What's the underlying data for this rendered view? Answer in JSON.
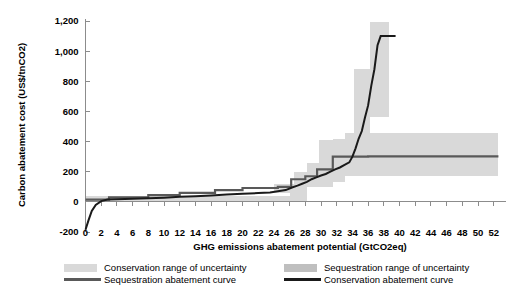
{
  "chart_data": {
    "type": "line",
    "title": "",
    "xlabel": "GHG emissions abatement  potential (GtCO2eq)",
    "ylabel": "Carbon abatement cost (US$/tnCO2)",
    "xlim": [
      0,
      53.5
    ],
    "ylim": [
      -200,
      1200
    ],
    "xticks": [
      0,
      2,
      4,
      6,
      8,
      10,
      12,
      14,
      16,
      18,
      20,
      22,
      24,
      26,
      28,
      30,
      32,
      34,
      36,
      38,
      40,
      42,
      44,
      46,
      48,
      50,
      52
    ],
    "xtick_labels": [
      "0",
      "2",
      "4",
      "6",
      "8",
      "10",
      "12",
      "14",
      "16",
      "18",
      "20",
      "22",
      "24",
      "26",
      "28",
      "30",
      "32",
      "34",
      "36",
      "38",
      "40",
      "42",
      "44",
      "46",
      "48",
      "50",
      "52"
    ],
    "yticks": [
      -200,
      0,
      200,
      400,
      600,
      800,
      1000,
      1200
    ],
    "ytick_labels": [
      "-200",
      "0",
      "200",
      "400",
      "600",
      "800",
      "1,000",
      "1,200"
    ],
    "grid": false,
    "legend_position": "bottom",
    "series": [
      {
        "name": "Sequestration abatement curve",
        "color": "#595959",
        "type": "step",
        "points": [
          [
            0,
            15
          ],
          [
            3.0,
            15
          ],
          [
            3.0,
            30
          ],
          [
            8.0,
            30
          ],
          [
            8.0,
            45
          ],
          [
            12.0,
            45
          ],
          [
            12.0,
            60
          ],
          [
            16.5,
            60
          ],
          [
            16.5,
            78
          ],
          [
            20.0,
            78
          ],
          [
            20.0,
            92
          ],
          [
            24.5,
            92
          ],
          [
            24.5,
            100
          ],
          [
            26.2,
            100
          ],
          [
            26.2,
            150
          ],
          [
            28.0,
            150
          ],
          [
            28.0,
            170
          ],
          [
            29.5,
            170
          ],
          [
            29.5,
            215
          ],
          [
            31.5,
            215
          ],
          [
            31.5,
            300
          ],
          [
            36.0,
            300
          ],
          [
            36.0,
            302
          ],
          [
            52.6,
            302
          ]
        ]
      },
      {
        "name": "Conservation abatement curve",
        "color": "#1a1a1a",
        "type": "step",
        "points": [
          [
            0,
            -185
          ],
          [
            0.4,
            -120
          ],
          [
            0.8,
            -60
          ],
          [
            1.3,
            -20
          ],
          [
            2.0,
            5
          ],
          [
            2.8,
            15
          ],
          [
            4.0,
            18
          ],
          [
            6.0,
            20
          ],
          [
            8.0,
            24
          ],
          [
            10.0,
            28
          ],
          [
            12.0,
            34
          ],
          [
            14.0,
            38
          ],
          [
            16.0,
            42
          ],
          [
            18.0,
            48
          ],
          [
            20.0,
            54
          ],
          [
            22.0,
            58
          ],
          [
            23.5,
            62
          ],
          [
            24.5,
            70
          ],
          [
            25.5,
            78
          ],
          [
            26.3,
            95
          ],
          [
            27.0,
            108
          ],
          [
            27.6,
            120
          ],
          [
            28.2,
            132
          ],
          [
            28.8,
            150
          ],
          [
            29.4,
            162
          ],
          [
            30.0,
            175
          ],
          [
            30.6,
            185
          ],
          [
            31.2,
            200
          ],
          [
            31.8,
            215
          ],
          [
            32.4,
            228
          ],
          [
            33.0,
            245
          ],
          [
            33.6,
            262
          ],
          [
            34.0,
            300
          ],
          [
            34.4,
            355
          ],
          [
            34.8,
            420
          ],
          [
            35.2,
            470
          ],
          [
            35.6,
            560
          ],
          [
            36.0,
            640
          ],
          [
            36.4,
            770
          ],
          [
            36.8,
            880
          ],
          [
            37.2,
            1040
          ],
          [
            37.6,
            1100
          ],
          [
            39.5,
            1100
          ]
        ]
      }
    ],
    "bands": [
      {
        "name": "Conservation range of uncertainty",
        "color": "#d9d9d9",
        "segments": [
          {
            "x0": 0.0,
            "x1": 26.0,
            "y0": 0,
            "y1": 38
          },
          {
            "x0": 26.0,
            "x1": 28.2,
            "y0": 0,
            "y1": 120
          },
          {
            "x0": 28.2,
            "x1": 31.5,
            "y0": 100,
            "y1": 255
          },
          {
            "x0": 31.5,
            "x1": 34.2,
            "y0": 175,
            "y1": 420
          },
          {
            "x0": 34.2,
            "x1": 36.2,
            "y0": 290,
            "y1": 880
          },
          {
            "x0": 36.2,
            "x1": 38.6,
            "y0": 560,
            "y1": 1195
          }
        ]
      },
      {
        "name": "Sequestration range of uncertainty",
        "color": "#d9d9d9",
        "segments": [
          {
            "x0": 0.0,
            "x1": 24.0,
            "y0": 5,
            "y1": 32
          },
          {
            "x0": 24.0,
            "x1": 26.5,
            "y0": 60,
            "y1": 120
          },
          {
            "x0": 26.5,
            "x1": 29.8,
            "y0": 110,
            "y1": 200
          },
          {
            "x0": 29.8,
            "x1": 33.0,
            "y0": 130,
            "y1": 410
          },
          {
            "x0": 33.0,
            "x1": 52.6,
            "y0": 170,
            "y1": 455
          }
        ]
      }
    ],
    "legend": [
      {
        "key": "conservation-band",
        "label": "Conservation range of uncertainty",
        "marker": "swatch",
        "color": "#d9d9d9"
      },
      {
        "key": "sequestration-band",
        "label": "Sequestration range of uncertainty",
        "marker": "swatch",
        "color": "#bfbfbf"
      },
      {
        "key": "sequestration-line",
        "label": "Sequestration abatement curve",
        "marker": "line",
        "color": "#595959"
      },
      {
        "key": "conservation-line",
        "label": "Conservation abatement curve",
        "marker": "line",
        "color": "#1a1a1a"
      }
    ]
  },
  "colors": {
    "axis": "#8c8c8c",
    "band_light": "#d9d9d9",
    "band_mid": "#bfbfbf",
    "seq_line": "#595959",
    "cons_line": "#1a1a1a",
    "background": "#ffffff"
  }
}
